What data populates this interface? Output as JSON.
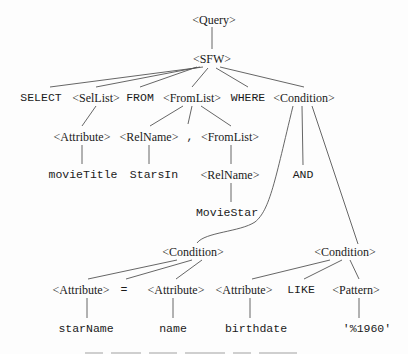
{
  "diagram": {
    "type": "parse-tree",
    "nodes": [
      {
        "id": "query",
        "label": "<Query>",
        "kind": "nonterminal",
        "x": 214,
        "y": 20
      },
      {
        "id": "sfw",
        "label": "<SFW>",
        "kind": "nonterminal",
        "x": 212,
        "y": 59
      },
      {
        "id": "select",
        "label": "SELECT",
        "kind": "terminal",
        "x": 41,
        "y": 98
      },
      {
        "id": "sellist",
        "label": "<SelList>",
        "kind": "nonterminal",
        "x": 96,
        "y": 98
      },
      {
        "id": "from",
        "label": "FROM",
        "kind": "terminal",
        "x": 140,
        "y": 98
      },
      {
        "id": "fromlist1",
        "label": "<FromList>",
        "kind": "nonterminal",
        "x": 192,
        "y": 98
      },
      {
        "id": "where",
        "label": "WHERE",
        "kind": "terminal",
        "x": 248,
        "y": 98
      },
      {
        "id": "cond_root",
        "label": "<Condition>",
        "kind": "nonterminal",
        "x": 304,
        "y": 98
      },
      {
        "id": "attr1",
        "label": "<Attribute>",
        "kind": "nonterminal",
        "x": 82,
        "y": 137
      },
      {
        "id": "relname1",
        "label": "<RelName>",
        "kind": "nonterminal",
        "x": 149,
        "y": 137
      },
      {
        "id": "comma",
        "label": ",",
        "kind": "terminal",
        "x": 190,
        "y": 137
      },
      {
        "id": "fromlist2",
        "label": "<FromList>",
        "kind": "nonterminal",
        "x": 230,
        "y": 137
      },
      {
        "id": "movietitle",
        "label": "movieTitle",
        "kind": "terminal",
        "x": 83,
        "y": 175
      },
      {
        "id": "starsin",
        "label": "StarsIn",
        "kind": "terminal",
        "x": 154,
        "y": 175
      },
      {
        "id": "relname2",
        "label": "<RelName>",
        "kind": "nonterminal",
        "x": 230,
        "y": 175
      },
      {
        "id": "and",
        "label": "AND",
        "kind": "terminal",
        "x": 303,
        "y": 175
      },
      {
        "id": "moviestar",
        "label": "MovieStar",
        "kind": "terminal",
        "x": 227,
        "y": 213
      },
      {
        "id": "cond_left",
        "label": "<Condition>",
        "kind": "nonterminal",
        "x": 193,
        "y": 252
      },
      {
        "id": "cond_right",
        "label": "<Condition>",
        "kind": "nonterminal",
        "x": 345,
        "y": 252
      },
      {
        "id": "attr2",
        "label": "<Attribute>",
        "kind": "nonterminal",
        "x": 81,
        "y": 290
      },
      {
        "id": "eq",
        "label": "=",
        "kind": "terminal",
        "x": 124,
        "y": 290
      },
      {
        "id": "attr3",
        "label": "<Attribute>",
        "kind": "nonterminal",
        "x": 176,
        "y": 290
      },
      {
        "id": "attr4",
        "label": "<Attribute>",
        "kind": "nonterminal",
        "x": 244,
        "y": 290
      },
      {
        "id": "like",
        "label": "LIKE",
        "kind": "terminal",
        "x": 301,
        "y": 290
      },
      {
        "id": "pattern",
        "label": "<Pattern>",
        "kind": "nonterminal",
        "x": 356,
        "y": 290
      },
      {
        "id": "starname",
        "label": "starName",
        "kind": "terminal",
        "x": 86,
        "y": 329
      },
      {
        "id": "name",
        "label": "name",
        "kind": "terminal",
        "x": 173,
        "y": 329
      },
      {
        "id": "birthdate",
        "label": "birthdate",
        "kind": "terminal",
        "x": 256,
        "y": 329
      },
      {
        "id": "pct1960",
        "label": "'%1960'",
        "kind": "terminal",
        "x": 367,
        "y": 329
      }
    ],
    "edges": [
      {
        "path": "M212,27 L212,49"
      },
      {
        "path": "M203,67 L50,87"
      },
      {
        "path": "M200,67 L96,87"
      },
      {
        "path": "M197,67 L140,87"
      },
      {
        "path": "M208,68 L192,87"
      },
      {
        "path": "M216,68 L248,87"
      },
      {
        "path": "M220,67 L304,87"
      },
      {
        "path": "M96,106 L82,126"
      },
      {
        "path": "M183,106 L150,126"
      },
      {
        "path": "M192,106 L188,124"
      },
      {
        "path": "M201,106 L231,126"
      },
      {
        "path": "M82,145 L82,164"
      },
      {
        "path": "M149,145 L149,164"
      },
      {
        "path": "M231,145 L231,164"
      },
      {
        "path": "M231,183 L231,202"
      },
      {
        "path": "M302,106 L303,165"
      },
      {
        "path": "M293,106 C275,180 270,210 255,222 C240,232 205,232 197,243"
      },
      {
        "path": "M312,106 L358,244"
      },
      {
        "path": "M177,260 L88,279"
      },
      {
        "path": "M192,260 L126,279"
      },
      {
        "path": "M202,260 L176,279"
      },
      {
        "path": "M330,260 L252,279"
      },
      {
        "path": "M342,260 L304,279"
      },
      {
        "path": "M350,260 L359,279"
      },
      {
        "path": "M87,298 L87,318"
      },
      {
        "path": "M173,298 L173,318"
      },
      {
        "path": "M250,298 L250,318"
      },
      {
        "path": "M359,298 L359,318"
      }
    ]
  },
  "caption": {
    "visible": "clipped"
  },
  "colors": {
    "ink": "#1a1a1a",
    "line": "#555555",
    "background": "#fdfdfd"
  }
}
